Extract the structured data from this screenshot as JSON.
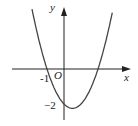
{
  "chart_data": {
    "type": "line",
    "title": "",
    "function": "y = x^2 - x - 2",
    "xlabel": "x",
    "ylabel": "y",
    "origin_label": "O",
    "tick_labels": {
      "x": [
        "-1"
      ],
      "y": [
        "-2"
      ]
    },
    "x_intercepts": [
      -1,
      2
    ],
    "y_intercept": -2,
    "vertex": [
      0.5,
      -2.25
    ],
    "xlim": [
      -1.9,
      3.9
    ],
    "ylim": [
      -3.1,
      3.5
    ],
    "grid": false,
    "legend": "none"
  },
  "labels": {
    "x_axis": "x",
    "y_axis": "y",
    "origin": "O",
    "x_tick": "-1",
    "y_tick": "−2"
  },
  "colors": {
    "axis": "#222222",
    "curve": "#444444"
  }
}
